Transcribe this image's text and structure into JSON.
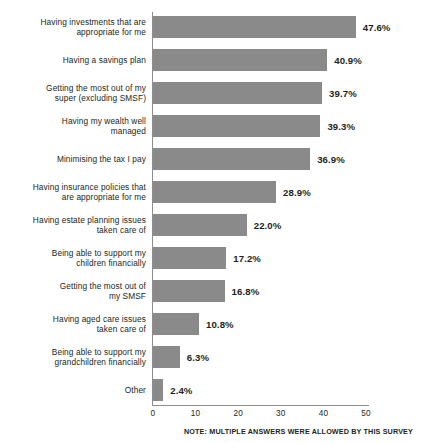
{
  "chart_data": {
    "type": "bar",
    "orientation": "horizontal",
    "title": "",
    "subtitle": "",
    "xlabel": "",
    "ylabel": "",
    "xlim": [
      0,
      50
    ],
    "xticks": [
      "0",
      "10",
      "20",
      "30",
      "40",
      "50"
    ],
    "grid": false,
    "legend": null,
    "bar_color": "#8a8a8a",
    "categories": [
      "Having investments that are\nappropriate for me",
      "Having a savings plan",
      "Getting the most out of my\nsuper (excluding SMSF)",
      "Having my wealth well\nmanaged",
      "Minimising the tax I pay",
      "Having insurance policies that\nare appropriate for me",
      "Having estate planning issues\ntaken care of",
      "Being able to support my\nchildren financially",
      "Getting the most out of\nmy SMSF",
      "Having aged care issues\ntaken care of",
      "Being able to support my\ngrandchildren financially",
      "Other"
    ],
    "values": [
      47.6,
      40.9,
      39.7,
      39.3,
      36.9,
      28.9,
      22.0,
      17.2,
      16.8,
      10.8,
      6.3,
      2.4
    ],
    "value_labels": [
      "47.6%",
      "40.9%",
      "39.7%",
      "39.3%",
      "36.9%",
      "28.9%",
      "22.0%",
      "17.2%",
      "16.8%",
      "10.8%",
      "6.3%",
      "2.4%"
    ],
    "annotations": [
      "NOTE: MULTIPLE ANSWERS WERE ALLOWED BY THIS SURVEY"
    ]
  },
  "footer": {
    "note": "NOTE: MULTIPLE ANSWERS WERE ALLOWED BY THIS SURVEY"
  }
}
